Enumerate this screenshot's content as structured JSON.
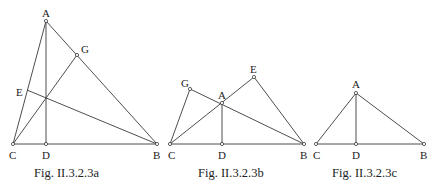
{
  "figures": [
    {
      "id": "a",
      "caption": "Fig. II.3.2.3a",
      "points": [
        {
          "name": "A",
          "label": "A"
        },
        {
          "name": "G",
          "label": "G"
        },
        {
          "name": "E",
          "label": "E"
        },
        {
          "name": "C",
          "label": "C"
        },
        {
          "name": "D",
          "label": "D"
        },
        {
          "name": "B",
          "label": "B"
        }
      ],
      "segments": [
        [
          "A",
          "C"
        ],
        [
          "A",
          "B"
        ],
        [
          "C",
          "B"
        ],
        [
          "A",
          "D"
        ],
        [
          "C",
          "G"
        ],
        [
          "B",
          "E"
        ]
      ]
    },
    {
      "id": "b",
      "caption": "Fig. II.3.2.3b",
      "points": [
        {
          "name": "G",
          "label": "G"
        },
        {
          "name": "E",
          "label": "E"
        },
        {
          "name": "A",
          "label": "A"
        },
        {
          "name": "C",
          "label": "C"
        },
        {
          "name": "D",
          "label": "D"
        },
        {
          "name": "B",
          "label": "B"
        }
      ],
      "segments": [
        [
          "C",
          "B"
        ],
        [
          "C",
          "E"
        ],
        [
          "E",
          "B"
        ],
        [
          "C",
          "G"
        ],
        [
          "G",
          "B"
        ],
        [
          "A",
          "D"
        ]
      ]
    },
    {
      "id": "c",
      "caption": "Fig. II.3.2.3c",
      "points": [
        {
          "name": "A",
          "label": "A"
        },
        {
          "name": "C",
          "label": "C"
        },
        {
          "name": "D",
          "label": "D"
        },
        {
          "name": "B",
          "label": "B"
        }
      ],
      "segments": [
        [
          "A",
          "C"
        ],
        [
          "A",
          "B"
        ],
        [
          "C",
          "B"
        ],
        [
          "A",
          "D"
        ]
      ]
    }
  ]
}
